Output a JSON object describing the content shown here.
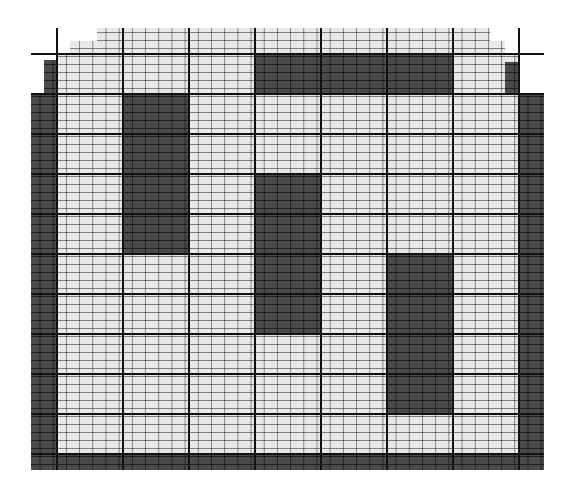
{
  "colors": {
    "light_cell": "#e8e8e8",
    "dark_cell": "#4a4a4a",
    "major_line": "#111111",
    "background": "#ffffff"
  },
  "grid": {
    "major_columns": 8,
    "major_rows": 10,
    "minor_per_major_col": 5,
    "minor_per_major_row": 5,
    "col_edges": [
      57,
      123,
      189,
      255,
      321,
      387,
      453,
      519
    ],
    "row_edges": [
      54,
      94,
      134,
      174,
      214,
      254,
      294,
      334,
      374,
      414,
      454
    ]
  },
  "regions": [
    {
      "kind": "light",
      "x": 97,
      "y": 28,
      "w": 393,
      "h": 13
    },
    {
      "kind": "light",
      "x": 70,
      "y": 41,
      "w": 435,
      "h": 13
    },
    {
      "kind": "light",
      "x": 57,
      "y": 54,
      "w": 462,
      "h": 400
    },
    {
      "kind": "dark",
      "x": 44,
      "y": 60,
      "w": 13,
      "h": 34
    },
    {
      "kind": "dark",
      "x": 505,
      "y": 62,
      "w": 14,
      "h": 32
    },
    {
      "kind": "dark",
      "x": 31,
      "y": 94,
      "w": 26,
      "h": 376
    },
    {
      "kind": "dark",
      "x": 519,
      "y": 94,
      "w": 25,
      "h": 376
    },
    {
      "kind": "dark",
      "x": 57,
      "y": 454,
      "w": 462,
      "h": 16
    },
    {
      "kind": "dark",
      "x": 255,
      "y": 54,
      "w": 198,
      "h": 40
    },
    {
      "kind": "dark",
      "x": 123,
      "y": 94,
      "w": 66,
      "h": 160
    },
    {
      "kind": "dark",
      "x": 255,
      "y": 174,
      "w": 66,
      "h": 160
    },
    {
      "kind": "dark",
      "x": 387,
      "y": 254,
      "w": 66,
      "h": 160
    }
  ]
}
